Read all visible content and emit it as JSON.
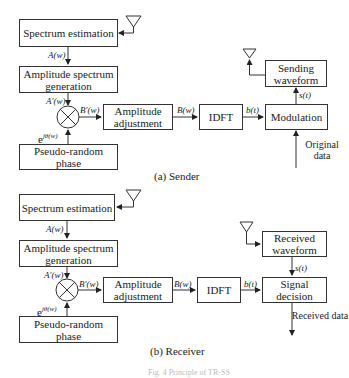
{
  "sender": {
    "caption": "(a) Sender",
    "spectrum_estimation": "Spectrum estimation",
    "amp_spectrum_gen": "Amplitude spectrum generation",
    "pseudo_random": "Pseudo-random phase",
    "amp_adjust": "Amplitude adjustment",
    "idft": "IDFT",
    "modulation": "Modulation",
    "sending_waveform": "Sending waveform",
    "original_data": "Original data",
    "labels": {
      "A": "A(w)",
      "A_prime": "A′(w)",
      "B_prime": "B′(w)",
      "B": "B(w)",
      "b": "b(t)",
      "s": "s(t)",
      "e_base": "e",
      "e_exp": "jθ(w)"
    }
  },
  "receiver": {
    "caption": "(b) Receiver",
    "spectrum_estimation": "Spectrum estimation",
    "amp_spectrum_gen": "Amplitude spectrum generation",
    "pseudo_random": "Pseudo-random phase",
    "amp_adjust": "Amplitude adjustment",
    "idft": "IDFT",
    "signal_decision": "Signal decision",
    "received_waveform": "Received waveform",
    "received_data": "Received data",
    "labels": {
      "A": "A(w)",
      "A_prime": "A′(w)",
      "B_prime": "B′(w)",
      "B": "B(w)",
      "b": "b(t)",
      "s": "s(t)",
      "e_base": "e",
      "e_exp": "jθ(w)"
    }
  },
  "figure_caption": "Fig. 4 Principle of TR-SS"
}
